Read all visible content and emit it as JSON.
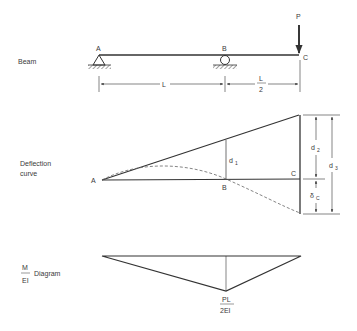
{
  "beam": {
    "label": "Beam",
    "points": {
      "A": "A",
      "B": "B",
      "C": "C"
    },
    "load": "P",
    "span_AB": "L",
    "span_BC_num": "L",
    "span_BC_den": "2"
  },
  "deflection": {
    "label_line1": "Deflection",
    "label_line2": "curve",
    "points": {
      "A": "A",
      "B": "B",
      "C": "C"
    },
    "d1": "d",
    "d1_sub": "1",
    "d2": "d",
    "d2_sub": "2",
    "d3": "d",
    "d3_sub": "3",
    "delta": "δ",
    "delta_sub": "C"
  },
  "moment": {
    "label_num": "M",
    "label_den": "EI",
    "label_text": "Diagram",
    "peak_num": "PL",
    "peak_den": "2EI"
  }
}
